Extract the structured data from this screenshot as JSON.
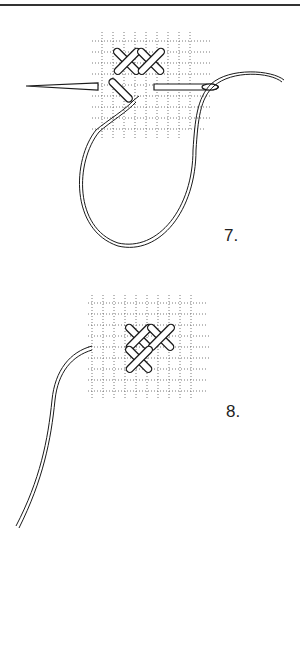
{
  "page": {
    "header_fragment": "· · ·"
  },
  "figures": [
    {
      "id": "fig-7",
      "step_label": "7.",
      "description": "Needle passes horizontally under grid threads, working thread looped below; two completed cross stitches and one half stitch"
    },
    {
      "id": "fig-8",
      "step_label": "8.",
      "description": "Thread pulled through; three cross stitches completed on grid, tail thread trailing to lower left"
    }
  ],
  "colors": {
    "ink": "#1a1a1a",
    "grid": "#555555",
    "paper": "#ffffff"
  }
}
